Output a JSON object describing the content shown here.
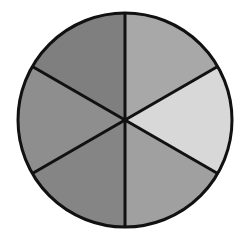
{
  "figure": {
    "name": "six-sector-pie-disc",
    "background_color": "#ffffff",
    "width": 250,
    "height": 246,
    "title": "",
    "caption": ""
  },
  "chart_data": {
    "type": "pie",
    "title": "",
    "subtitle": "",
    "xlabel": "",
    "ylabel": "",
    "legend_position": "none",
    "grid": false,
    "labels_shown": false,
    "center_x": 125,
    "center_y": 120,
    "radius": 107,
    "start_angle_deg": -90,
    "direction": "clockwise",
    "slice_count": 6,
    "equal_slices": true,
    "slice_angle_deg": 60,
    "outline_color": "#111111",
    "outline_width": 3,
    "divider_color": "#111111",
    "divider_width": 3,
    "categories": [
      "top-middle",
      "top-right",
      "bottom-right",
      "bottom-middle",
      "bottom-left",
      "top-left"
    ],
    "values": [
      16.67,
      16.67,
      16.67,
      16.67,
      16.67,
      16.67
    ],
    "colors": [
      "#a8a8a8",
      "#d8d8d8",
      "#a0a0a0",
      "#858585",
      "#8e8e8e",
      "#7f7f7f"
    ],
    "slices": [
      {
        "label": "top-middle",
        "value": 16.67,
        "angle_deg": 60,
        "start_deg": -90,
        "end_deg": -30,
        "color": "#a8a8a8"
      },
      {
        "label": "top-right",
        "value": 16.67,
        "angle_deg": 60,
        "start_deg": -30,
        "end_deg": 30,
        "color": "#d8d8d8"
      },
      {
        "label": "bottom-right",
        "value": 16.67,
        "angle_deg": 60,
        "start_deg": 30,
        "end_deg": 90,
        "color": "#a0a0a0"
      },
      {
        "label": "bottom-middle",
        "value": 16.67,
        "angle_deg": 60,
        "start_deg": 90,
        "end_deg": 150,
        "color": "#858585"
      },
      {
        "label": "bottom-left",
        "value": 16.67,
        "angle_deg": 60,
        "start_deg": 150,
        "end_deg": 210,
        "color": "#8e8e8e"
      },
      {
        "label": "top-left",
        "value": 16.67,
        "angle_deg": 60,
        "start_deg": 210,
        "end_deg": 270,
        "color": "#7f7f7f"
      }
    ]
  }
}
